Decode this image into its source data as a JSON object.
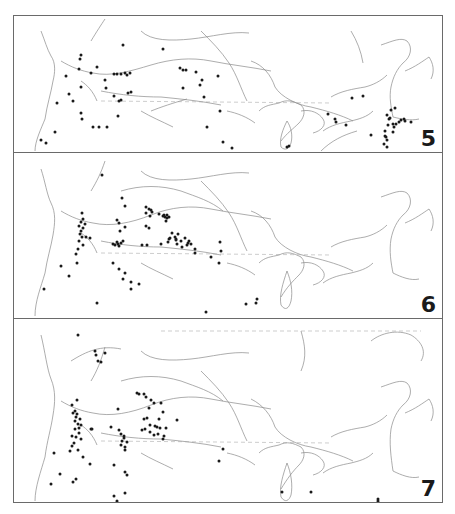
{
  "figure": {
    "panels": [
      {
        "number": "5",
        "dots": [
          [
            40,
            139
          ],
          [
            45,
            142
          ],
          [
            54,
            131
          ],
          [
            68,
            93
          ],
          [
            80,
            86
          ],
          [
            80,
            54
          ],
          [
            79,
            58
          ],
          [
            78,
            68
          ],
          [
            90,
            72
          ],
          [
            96,
            66
          ],
          [
            65,
            75
          ],
          [
            72,
            100
          ],
          [
            56,
            102
          ],
          [
            80,
            112
          ],
          [
            81,
            118
          ],
          [
            92,
            126
          ],
          [
            98,
            126
          ],
          [
            106,
            126
          ],
          [
            105,
            87
          ],
          [
            104,
            79
          ],
          [
            113,
            73
          ],
          [
            116,
            73
          ],
          [
            120,
            73
          ],
          [
            124,
            72
          ],
          [
            126,
            74
          ],
          [
            129,
            72
          ],
          [
            113,
            95
          ],
          [
            118,
            100
          ],
          [
            120,
            99
          ],
          [
            127,
            92
          ],
          [
            130,
            91
          ],
          [
            117,
            115
          ],
          [
            122,
            44
          ],
          [
            162,
            48
          ],
          [
            179,
            67
          ],
          [
            182,
            69
          ],
          [
            185,
            69
          ],
          [
            195,
            71
          ],
          [
            182,
            87
          ],
          [
            201,
            79
          ],
          [
            199,
            84
          ],
          [
            203,
            96
          ],
          [
            217,
            75
          ],
          [
            219,
            110
          ],
          [
            206,
            126
          ],
          [
            222,
            141
          ],
          [
            231,
            147
          ],
          [
            286,
            146
          ],
          [
            288,
            145
          ],
          [
            327,
            113
          ],
          [
            334,
            118
          ],
          [
            335,
            121
          ],
          [
            345,
            124
          ],
          [
            351,
            97
          ],
          [
            362,
            95
          ],
          [
            390,
            109
          ],
          [
            386,
            114
          ],
          [
            388,
            118
          ],
          [
            387,
            124
          ],
          [
            384,
            130
          ],
          [
            384,
            135
          ],
          [
            386,
            139
          ],
          [
            383,
            143
          ],
          [
            392,
            131
          ],
          [
            393,
            126
          ],
          [
            395,
            123
          ],
          [
            398,
            121
          ],
          [
            400,
            119
          ],
          [
            403,
            118
          ],
          [
            385,
            136
          ],
          [
            370,
            134
          ],
          [
            389,
            117
          ],
          [
            392,
            123
          ],
          [
            404,
            120
          ],
          [
            410,
            121
          ],
          [
            394,
            107
          ],
          [
            386,
            146
          ]
        ]
      },
      {
        "number": "6",
        "dots": [
          [
            101,
            174
          ],
          [
            121,
            197
          ],
          [
            124,
            205
          ],
          [
            145,
            206
          ],
          [
            148,
            208
          ],
          [
            150,
            209
          ],
          [
            145,
            212
          ],
          [
            151,
            211
          ],
          [
            149,
            215
          ],
          [
            163,
            214
          ],
          [
            164,
            216
          ],
          [
            166,
            217
          ],
          [
            165,
            220
          ],
          [
            168,
            216
          ],
          [
            162,
            215
          ],
          [
            166,
            214
          ],
          [
            158,
            213
          ],
          [
            81,
            212
          ],
          [
            82,
            218
          ],
          [
            80,
            221
          ],
          [
            84,
            223
          ],
          [
            78,
            225
          ],
          [
            82,
            227
          ],
          [
            80,
            230
          ],
          [
            79,
            233
          ],
          [
            81,
            236
          ],
          [
            78,
            240
          ],
          [
            82,
            244
          ],
          [
            77,
            248
          ],
          [
            75,
            253
          ],
          [
            85,
            236
          ],
          [
            89,
            237
          ],
          [
            116,
            219
          ],
          [
            118,
            222
          ],
          [
            124,
            226
          ],
          [
            119,
            230
          ],
          [
            145,
            225
          ],
          [
            148,
            227
          ],
          [
            171,
            232
          ],
          [
            174,
            236
          ],
          [
            177,
            233
          ],
          [
            175,
            238
          ],
          [
            175,
            239
          ],
          [
            169,
            237
          ],
          [
            167,
            241
          ],
          [
            180,
            240
          ],
          [
            184,
            237
          ],
          [
            188,
            240
          ],
          [
            187,
            242
          ],
          [
            186,
            244
          ],
          [
            190,
            243
          ],
          [
            112,
            243
          ],
          [
            114,
            244
          ],
          [
            117,
            243
          ],
          [
            120,
            242
          ],
          [
            122,
            240
          ],
          [
            116,
            241
          ],
          [
            118,
            245
          ],
          [
            146,
            244
          ],
          [
            141,
            244
          ],
          [
            160,
            243
          ],
          [
            168,
            238
          ],
          [
            176,
            243
          ],
          [
            181,
            246
          ],
          [
            194,
            248
          ],
          [
            219,
            241
          ],
          [
            220,
            250
          ],
          [
            194,
            252
          ],
          [
            210,
            256
          ],
          [
            218,
            262
          ],
          [
            60,
            265
          ],
          [
            76,
            262
          ],
          [
            68,
            275
          ],
          [
            112,
            262
          ],
          [
            118,
            268
          ],
          [
            124,
            272
          ],
          [
            122,
            278
          ],
          [
            130,
            281
          ],
          [
            138,
            283
          ],
          [
            130,
            288
          ],
          [
            43,
            288
          ],
          [
            96,
            302
          ],
          [
            205,
            311
          ],
          [
            255,
            302
          ],
          [
            256,
            298
          ],
          [
            245,
            303
          ]
        ]
      },
      {
        "number": "7",
        "dots": [
          [
            94,
            350
          ],
          [
            95,
            354
          ],
          [
            104,
            352
          ],
          [
            97,
            360
          ],
          [
            100,
            361
          ],
          [
            77,
            334
          ],
          [
            76,
            399
          ],
          [
            71,
            404
          ],
          [
            74,
            410
          ],
          [
            72,
            412
          ],
          [
            76,
            413
          ],
          [
            75,
            416
          ],
          [
            79,
            418
          ],
          [
            74,
            420
          ],
          [
            77,
            423
          ],
          [
            80,
            424
          ],
          [
            78,
            427
          ],
          [
            74,
            428
          ],
          [
            78,
            432
          ],
          [
            75,
            436
          ],
          [
            71,
            435
          ],
          [
            80,
            438
          ],
          [
            73,
            442
          ],
          [
            69,
            450
          ],
          [
            90,
            428
          ],
          [
            77,
            449
          ],
          [
            136,
            392
          ],
          [
            138,
            393
          ],
          [
            143,
            393
          ],
          [
            145,
            396
          ],
          [
            150,
            399
          ],
          [
            153,
            402
          ],
          [
            148,
            407
          ],
          [
            160,
            402
          ],
          [
            162,
            411
          ],
          [
            158,
            418
          ],
          [
            143,
            418
          ],
          [
            146,
            417
          ],
          [
            149,
            424
          ],
          [
            154,
            425
          ],
          [
            156,
            426
          ],
          [
            149,
            431
          ],
          [
            157,
            433
          ],
          [
            163,
            435
          ],
          [
            162,
            438
          ],
          [
            153,
            434
          ],
          [
            159,
            427
          ],
          [
            176,
            419
          ],
          [
            165,
            427
          ],
          [
            118,
            429
          ],
          [
            120,
            433
          ],
          [
            123,
            435
          ],
          [
            121,
            440
          ],
          [
            126,
            441
          ],
          [
            120,
            444
          ],
          [
            124,
            446
          ],
          [
            141,
            429
          ],
          [
            144,
            428
          ],
          [
            117,
            408
          ],
          [
            110,
            426
          ],
          [
            91,
            428
          ],
          [
            123,
            437
          ],
          [
            124,
            449
          ],
          [
            53,
            452
          ],
          [
            71,
            445
          ],
          [
            82,
            456
          ],
          [
            89,
            463
          ],
          [
            113,
            464
          ],
          [
            124,
            471
          ],
          [
            126,
            474
          ],
          [
            75,
            478
          ],
          [
            59,
            473
          ],
          [
            50,
            483
          ],
          [
            72,
            481
          ],
          [
            113,
            495
          ],
          [
            124,
            492
          ],
          [
            116,
            500
          ],
          [
            218,
            460
          ],
          [
            222,
            448
          ],
          [
            281,
            491
          ],
          [
            310,
            491
          ],
          [
            377,
            498
          ],
          [
            377,
            500
          ]
        ]
      }
    ]
  }
}
